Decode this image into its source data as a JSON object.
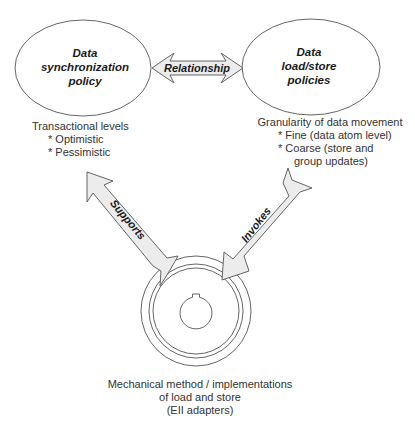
{
  "nodes": {
    "sync_policy": {
      "title_lines": [
        "Data",
        "synchronization",
        "policy"
      ],
      "notes": [
        "Transactional levels",
        "* Optimistic",
        "* Pessimistic"
      ]
    },
    "load_store": {
      "title_lines": [
        "Data",
        "load/store",
        "policies"
      ],
      "notes": [
        "Granularity of data movement",
        "* Fine (data atom level)",
        "* Coarse (store and",
        "group updates)"
      ]
    },
    "mechanism": {
      "notes": [
        "Mechanical method / implementations",
        "of load and store",
        "(EII adapters)"
      ]
    }
  },
  "edges": {
    "relationship": {
      "label": "Relationship",
      "direction": "bidirectional"
    },
    "supports": {
      "label": "Supports",
      "from": "mechanism",
      "to": "sync_policy"
    },
    "invokes": {
      "label": "Invokes",
      "from": "load_store",
      "to": "mechanism"
    }
  },
  "colors": {
    "stroke": "#555555",
    "arrow_fill": "#ececec",
    "text": "#333333"
  }
}
